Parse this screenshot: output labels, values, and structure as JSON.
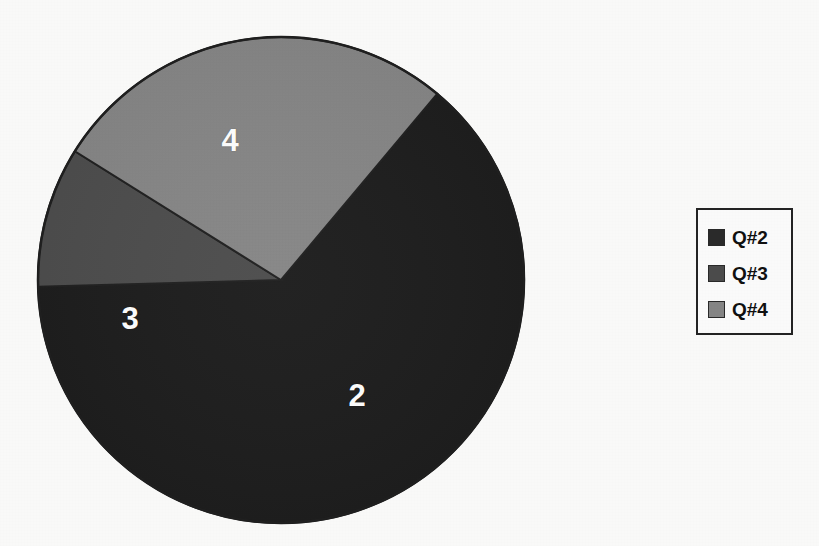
{
  "chart_data": {
    "type": "pie",
    "title": "",
    "subtitle": "",
    "xlabel": "",
    "ylabel": "",
    "grid": false,
    "legend_position": "right",
    "categories": [
      "Q#2",
      "Q#3",
      "Q#4"
    ],
    "slice_labels": [
      "2",
      "3",
      "4"
    ],
    "values": [
      72.2,
      10.6,
      31.1
    ],
    "percentages": [
      63.4,
      9.3,
      27.3
    ],
    "angles_deg": [
      228.4,
      33.6,
      98.0
    ],
    "colors": [
      "#1c1c1c",
      "#4d4d4d",
      "#878787"
    ],
    "annotations": [
      {
        "text": "2",
        "slice": "Q#2",
        "x": 357,
        "y": 395
      },
      {
        "text": "3",
        "slice": "Q#3",
        "x": 130,
        "y": 318
      },
      {
        "text": "4",
        "slice": "Q#4",
        "x": 230,
        "y": 140
      }
    ],
    "geometry": {
      "center_x": 281,
      "center_y": 280,
      "radius": 243,
      "start_angle_deg": -50,
      "direction": "clockwise"
    }
  },
  "pie": {
    "slices": [
      {
        "id": "slice-q2",
        "legend_key": "Q#2",
        "label": "2",
        "color": "#1c1c1c",
        "label_x": 357,
        "label_y": 395
      },
      {
        "id": "slice-q3",
        "legend_key": "Q#3",
        "label": "3",
        "color": "#4d4d4d",
        "label_x": 130,
        "label_y": 318
      },
      {
        "id": "slice-q4",
        "legend_key": "Q#4",
        "label": "4",
        "color": "#878787",
        "label_x": 230,
        "label_y": 140
      }
    ],
    "outline_color": "#1f1f1f"
  },
  "legend": {
    "border_color": "#242424",
    "background": "#fefefe",
    "items": [
      {
        "label": "Q#2",
        "color": "#2b2b2b"
      },
      {
        "label": "Q#3",
        "color": "#4d4d4d"
      },
      {
        "label": "Q#4",
        "color": "#878787"
      }
    ]
  },
  "page": {
    "background": "#fdfdfc"
  }
}
